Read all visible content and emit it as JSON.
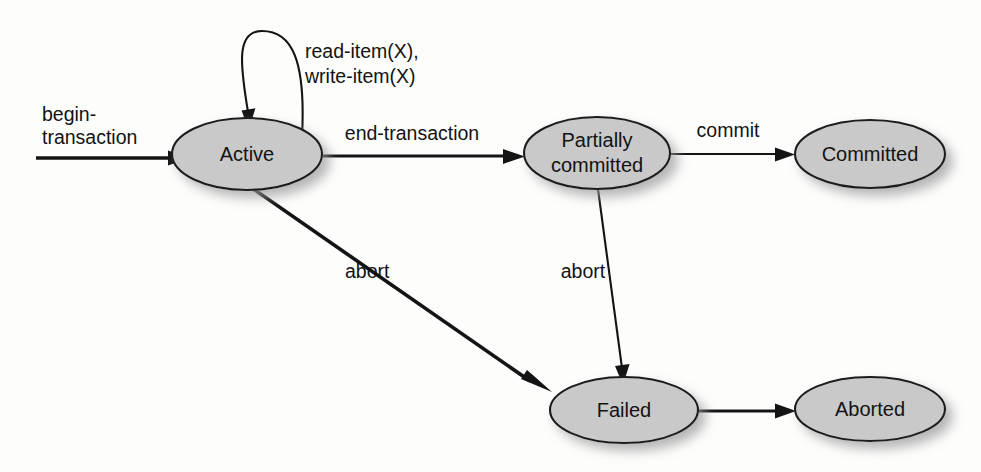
{
  "figure": {
    "kind": "state-transition-diagram",
    "background_color": "#fdfdfc",
    "node_fill_color": "#c9c9c9",
    "node_stroke_color": "#1c1c1c",
    "edge_color": "#141414"
  },
  "nodes": [
    {
      "id": "active",
      "label": "Active",
      "label_line2": ""
    },
    {
      "id": "partially_committed",
      "label": "Partially",
      "label_line2": "committed"
    },
    {
      "id": "committed",
      "label": "Committed",
      "label_line2": ""
    },
    {
      "id": "failed",
      "label": "Failed",
      "label_line2": ""
    },
    {
      "id": "aborted",
      "label": "Aborted",
      "label_line2": ""
    }
  ],
  "edges": [
    {
      "id": "begin",
      "from": "",
      "to": "active",
      "label": "begin-",
      "label_line2": "transaction"
    },
    {
      "id": "self_loop",
      "from": "active",
      "to": "active",
      "label": "read-item(X),",
      "label_line2": "write-item(X)"
    },
    {
      "id": "end",
      "from": "active",
      "to": "partially_committed",
      "label": "end-transaction",
      "label_line2": ""
    },
    {
      "id": "commit",
      "from": "partially_committed",
      "to": "committed",
      "label": "commit",
      "label_line2": ""
    },
    {
      "id": "abort_active",
      "from": "active",
      "to": "failed",
      "label": "abort",
      "label_line2": ""
    },
    {
      "id": "abort_partial",
      "from": "partially_committed",
      "to": "failed",
      "label": "abort",
      "label_line2": ""
    },
    {
      "id": "failed_abort",
      "from": "failed",
      "to": "aborted",
      "label": "",
      "label_line2": ""
    }
  ]
}
